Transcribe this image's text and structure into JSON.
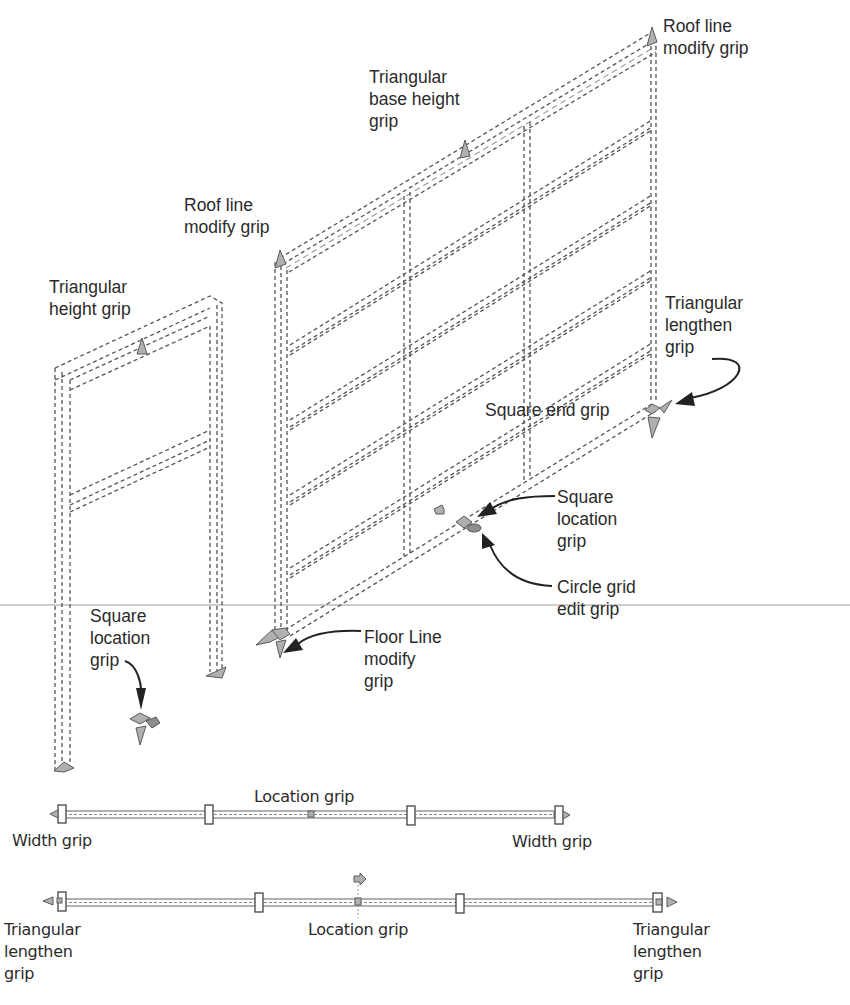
{
  "figure": {
    "divider_color": "#9a9a9a",
    "grip_color": "#b0b0b0",
    "line_color": "#555555"
  },
  "labels": {
    "roof_line_top_right": "Roof line\nmodify grip",
    "triangular_base_height": "Triangular\nbase height\ngrip",
    "roof_line_left": "Roof line\nmodify grip",
    "triangular_height": "Triangular\nheight grip",
    "triangular_lengthen_right": "Triangular\nlengthen\ngrip",
    "square_end": "Square end grip",
    "square_location_center": "Square\nlocation\ngrip",
    "circle_grid_edit": "Circle grid\nedit grip",
    "square_location_left": "Square\nlocation\ngrip",
    "floor_line_modify": "Floor Line\nmodify\ngrip",
    "location_grip_top": "Location grip",
    "width_grip_left": "Width grip",
    "width_grip_right": "Width grip",
    "triangular_lengthen_bottom_left": "Triangular\nlengthen\ngrip",
    "location_grip_bottom": "Location grip",
    "triangular_lengthen_bottom_right": "Triangular\nlengthen\ngrip"
  }
}
